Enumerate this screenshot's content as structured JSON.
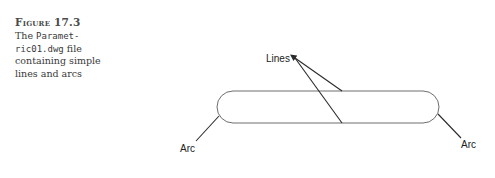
{
  "caption": {
    "figure_label": "Figure 17.3",
    "line1_prefix": "The ",
    "line1_code": "Paramet-",
    "line2_code": "ric01.dwg",
    "line2_suffix": " file",
    "line3": "containing simple",
    "line4": "lines and arcs"
  },
  "drawing": {
    "labels": {
      "lines": "Lines",
      "arc_left": "Arc",
      "arc_right": "Arc"
    },
    "colors": {
      "shape_stroke": "#6e6e6e",
      "leader_stroke": "#2a2a2a"
    }
  }
}
